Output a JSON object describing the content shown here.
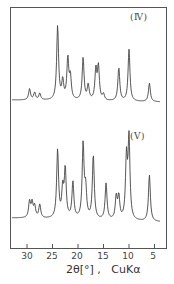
{
  "chart_data": {
    "type": "line",
    "title": "",
    "xlabel": "2θ[°] ,   CuKα",
    "ylabel": "",
    "xlim": [
      33,
      3
    ],
    "x_reversed": true,
    "xticks": [
      30,
      25,
      20,
      15,
      10,
      5
    ],
    "grid": false,
    "legend": "inline labels at top right of each trace",
    "series": [
      {
        "name": "(Ⅳ)",
        "peaks_2theta_relative_intensity": [
          {
            "x": 29.5,
            "y": 0.15
          },
          {
            "x": 28.5,
            "y": 0.1
          },
          {
            "x": 27.5,
            "y": 0.09
          },
          {
            "x": 24.0,
            "y": 1.0
          },
          {
            "x": 23.0,
            "y": 0.25
          },
          {
            "x": 22.0,
            "y": 0.55
          },
          {
            "x": 21.5,
            "y": 0.3
          },
          {
            "x": 19.0,
            "y": 0.57
          },
          {
            "x": 18.0,
            "y": 0.2
          },
          {
            "x": 16.5,
            "y": 0.4
          },
          {
            "x": 16.0,
            "y": 0.45
          },
          {
            "x": 15.0,
            "y": 0.08
          },
          {
            "x": 12.0,
            "y": 0.45
          },
          {
            "x": 10.0,
            "y": 0.7
          },
          {
            "x": 6.0,
            "y": 0.25
          }
        ]
      },
      {
        "name": "(Ⅴ)",
        "peaks_2theta_relative_intensity": [
          {
            "x": 29.5,
            "y": 0.2
          },
          {
            "x": 29.0,
            "y": 0.18
          },
          {
            "x": 28.5,
            "y": 0.14
          },
          {
            "x": 27.5,
            "y": 0.17
          },
          {
            "x": 24.0,
            "y": 0.85
          },
          {
            "x": 23.0,
            "y": 0.35
          },
          {
            "x": 22.5,
            "y": 0.6
          },
          {
            "x": 21.0,
            "y": 0.45
          },
          {
            "x": 19.0,
            "y": 0.92
          },
          {
            "x": 18.5,
            "y": 0.35
          },
          {
            "x": 17.0,
            "y": 0.8
          },
          {
            "x": 14.5,
            "y": 0.45
          },
          {
            "x": 12.5,
            "y": 0.28
          },
          {
            "x": 12.0,
            "y": 0.28
          },
          {
            "x": 10.5,
            "y": 0.75
          },
          {
            "x": 10.0,
            "y": 1.0
          },
          {
            "x": 6.0,
            "y": 0.58
          }
        ]
      }
    ]
  },
  "labels": {
    "trace_iv": "(Ⅳ)",
    "trace_v": "(Ⅴ)",
    "xaxis": "2θ[°] ,   CuKα",
    "ticks": [
      "30",
      "25",
      "20",
      "15",
      "10",
      "5"
    ]
  }
}
